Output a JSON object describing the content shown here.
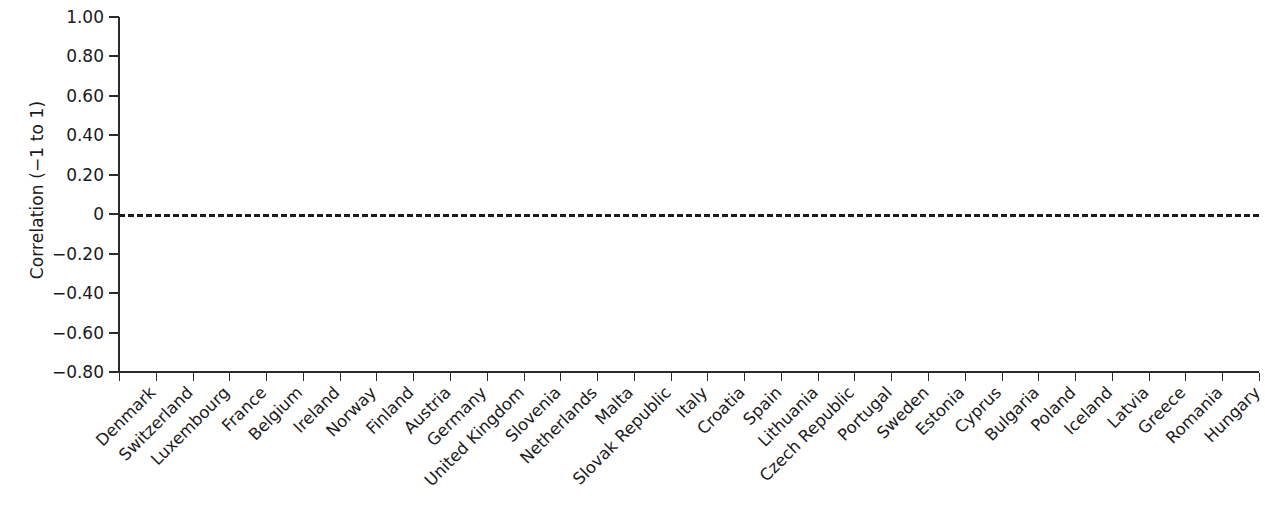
{
  "chart_data": {
    "type": "bar",
    "title": "",
    "xlabel": "",
    "ylabel": "Correlation (−1 to 1)",
    "ylim": [
      -0.8,
      1.0
    ],
    "yticks": [
      "1.00",
      "0.80",
      "0.60",
      "0.40",
      "0.20",
      "0",
      "−0.20",
      "−0.40",
      "−0.60",
      "−0.80"
    ],
    "ytick_values": [
      1.0,
      0.8,
      0.6,
      0.4,
      0.2,
      0.0,
      -0.2,
      -0.4,
      -0.6,
      -0.8
    ],
    "grid": false,
    "legend": "none",
    "zero_reference_line": true,
    "bar_color": "#7a7a7a",
    "highlight_color": "#dedede",
    "highlight_category": "Romania",
    "categories": [
      "Denmark",
      "Switzerland",
      "Luxembourg",
      "France",
      "Belgium",
      "Ireland",
      "Norway",
      "Finland",
      "Austria",
      "Germany",
      "United Kingdom",
      "Slovenia",
      "Netherlands",
      "Malta",
      "Slovak Republic",
      "Italy",
      "Croatia",
      "Spain",
      "Lithuania",
      "Czech Republic",
      "Portugal",
      "Sweden",
      "Estonia",
      "Cyprus",
      "Bulgaria",
      "Poland",
      "Iceland",
      "Latvia",
      "Greece",
      "Romania",
      "Hungary"
    ],
    "values": [
      -0.7,
      -0.6,
      -0.52,
      -0.44,
      -0.32,
      -0.31,
      -0.25,
      -0.24,
      -0.22,
      -0.23,
      -0.11,
      -0.09,
      -0.04,
      0.15,
      0.15,
      0.175,
      0.22,
      0.23,
      0.245,
      0.25,
      0.29,
      0.36,
      0.38,
      0.39,
      0.4,
      0.42,
      0.49,
      0.52,
      0.61,
      0.66,
      0.86
    ]
  }
}
